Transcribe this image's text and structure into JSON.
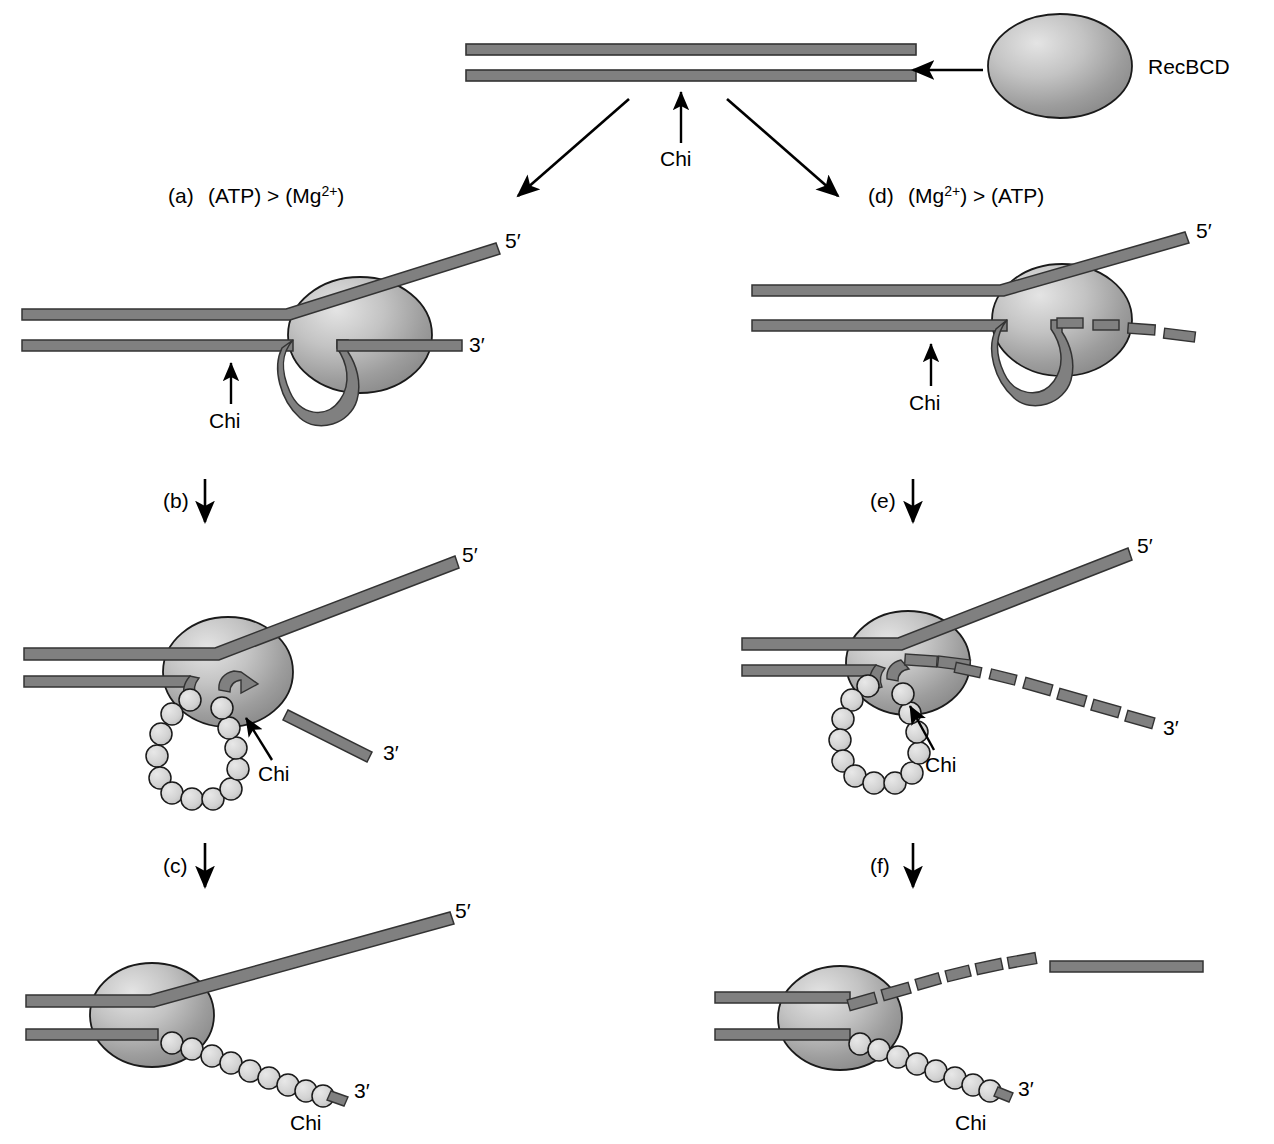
{
  "figure": {
    "title_text": "RecBCD",
    "colors": {
      "dna_fill": "#808080",
      "dna_stroke": "#333333",
      "protein_fill_light": "#d9d9d9",
      "protein_fill_dark": "#8a8a8a",
      "protein_stroke": "#1a1a1a",
      "ssb_bead_fill": "#d4d4d4",
      "ssb_bead_stroke": "#1a1a1a",
      "arrow_color": "#000000",
      "background": "#ffffff"
    }
  },
  "top": {
    "enzyme_label": "RecBCD",
    "chi_label": "Chi"
  },
  "panels": [
    {
      "id": "a",
      "label": "(a)",
      "condition": "(ATP) > (Mg",
      "condition_sup": "2+",
      "condition_tail": ")",
      "full_label": "(a) (ATP) > (Mg2+)",
      "chi_label": "Chi",
      "five_prime": "5′",
      "three_prime": "3′"
    },
    {
      "id": "b",
      "label": "(b)",
      "chi_label": "Chi",
      "five_prime": "5′",
      "three_prime": "3′"
    },
    {
      "id": "c",
      "label": "(c)",
      "chi_label": "Chi",
      "five_prime": "5′",
      "three_prime": "3′"
    },
    {
      "id": "d",
      "label": "(d)",
      "condition": "(Mg",
      "condition_sup": "2+",
      "condition_tail": ") > (ATP)",
      "full_label": "(d) (Mg2+) > (ATP)",
      "chi_label": "Chi",
      "five_prime": "5′"
    },
    {
      "id": "e",
      "label": "(e)",
      "chi_label": "Chi",
      "five_prime": "5′",
      "three_prime": "3′"
    },
    {
      "id": "f",
      "label": "(f)",
      "chi_label": "Chi",
      "three_prime": "3′"
    }
  ],
  "labels": {
    "panel_a_prefix": "(a)",
    "panel_a_atp": "(ATP) > (Mg",
    "panel_a_sup": "2+",
    "panel_a_close": ")",
    "panel_d_prefix": "(d)",
    "panel_d_mg": "(Mg",
    "panel_d_sup": "2+",
    "panel_d_close": ") > (ATP)",
    "panel_b": "(b)",
    "panel_c": "(c)",
    "panel_e": "(e)",
    "panel_f": "(f)",
    "chi": "Chi",
    "five_prime": "5′",
    "three_prime": "3′",
    "recbcd": "RecBCD"
  }
}
